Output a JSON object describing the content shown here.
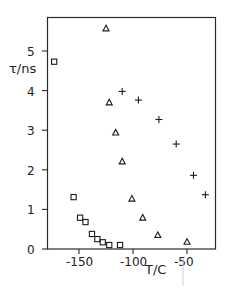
{
  "chart_data": {
    "type": "scatter",
    "title": "",
    "xlabel": "T/C",
    "ylabel": "τ/ns",
    "xlim": [
      -180,
      -23
    ],
    "ylim": [
      0,
      5.9
    ],
    "xticks": [
      -150,
      -100,
      -50
    ],
    "xtick_labels": [
      "-150",
      "-100",
      "-50"
    ],
    "yticks": [
      0,
      1,
      2,
      3,
      4,
      5
    ],
    "ytick_labels": [
      "0",
      "1",
      "2",
      "3",
      "4",
      "5"
    ],
    "grid": false,
    "legend": null,
    "series": [
      {
        "name": "squares",
        "marker": "square",
        "points": [
          {
            "x": -173,
            "y": 4.73
          },
          {
            "x": -155,
            "y": 1.31
          },
          {
            "x": -149,
            "y": 0.79
          },
          {
            "x": -144,
            "y": 0.68
          },
          {
            "x": -138,
            "y": 0.38
          },
          {
            "x": -133,
            "y": 0.25
          },
          {
            "x": -128,
            "y": 0.17
          },
          {
            "x": -122,
            "y": 0.1
          },
          {
            "x": -112,
            "y": 0.1
          }
        ]
      },
      {
        "name": "triangles",
        "marker": "triangle",
        "points": [
          {
            "x": -125,
            "y": 5.57
          },
          {
            "x": -122,
            "y": 3.7
          },
          {
            "x": -116,
            "y": 2.94
          },
          {
            "x": -110,
            "y": 2.21
          },
          {
            "x": -101,
            "y": 1.27
          },
          {
            "x": -91,
            "y": 0.79
          },
          {
            "x": -77,
            "y": 0.35
          },
          {
            "x": -50,
            "y": 0.18
          }
        ]
      },
      {
        "name": "crosses",
        "marker": "plus",
        "points": [
          {
            "x": -110,
            "y": 3.98
          },
          {
            "x": -95,
            "y": 3.76
          },
          {
            "x": -76,
            "y": 3.27
          },
          {
            "x": -60,
            "y": 2.65
          },
          {
            "x": -44,
            "y": 1.86
          },
          {
            "x": -33,
            "y": 1.37
          }
        ]
      }
    ]
  }
}
